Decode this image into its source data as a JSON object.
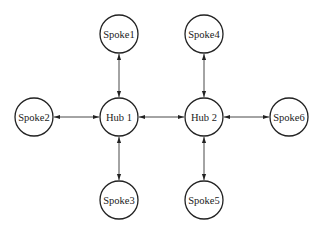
{
  "diagram": {
    "type": "hub-and-spoke network",
    "node_radius": 19,
    "colors": {
      "stroke": "#222222",
      "fill": "#ffffff",
      "background": "#ffffff"
    },
    "nodes": [
      {
        "id": "spoke1",
        "label": "Spoke1",
        "cx": 119,
        "cy": 34
      },
      {
        "id": "spoke2",
        "label": "Spoke2",
        "cx": 34,
        "cy": 117
      },
      {
        "id": "hub1",
        "label": "Hub 1",
        "cx": 119,
        "cy": 117
      },
      {
        "id": "hub2",
        "label": "Hub 2",
        "cx": 204,
        "cy": 117
      },
      {
        "id": "spoke6",
        "label": "Spoke6",
        "cx": 289,
        "cy": 117
      },
      {
        "id": "spoke3",
        "label": "Spoke3",
        "cx": 119,
        "cy": 200
      },
      {
        "id": "spoke4",
        "label": "Spoke4",
        "cx": 204,
        "cy": 34
      },
      {
        "id": "spoke5",
        "label": "Spoke5",
        "cx": 204,
        "cy": 200
      }
    ],
    "edges": [
      {
        "from": "spoke1",
        "to": "hub1",
        "direction": "both"
      },
      {
        "from": "spoke2",
        "to": "hub1",
        "direction": "both"
      },
      {
        "from": "spoke3",
        "to": "hub1",
        "direction": "both"
      },
      {
        "from": "hub1",
        "to": "hub2",
        "direction": "both"
      },
      {
        "from": "spoke4",
        "to": "hub2",
        "direction": "both"
      },
      {
        "from": "spoke5",
        "to": "hub2",
        "direction": "both"
      },
      {
        "from": "spoke6",
        "to": "hub2",
        "direction": "both"
      }
    ]
  }
}
